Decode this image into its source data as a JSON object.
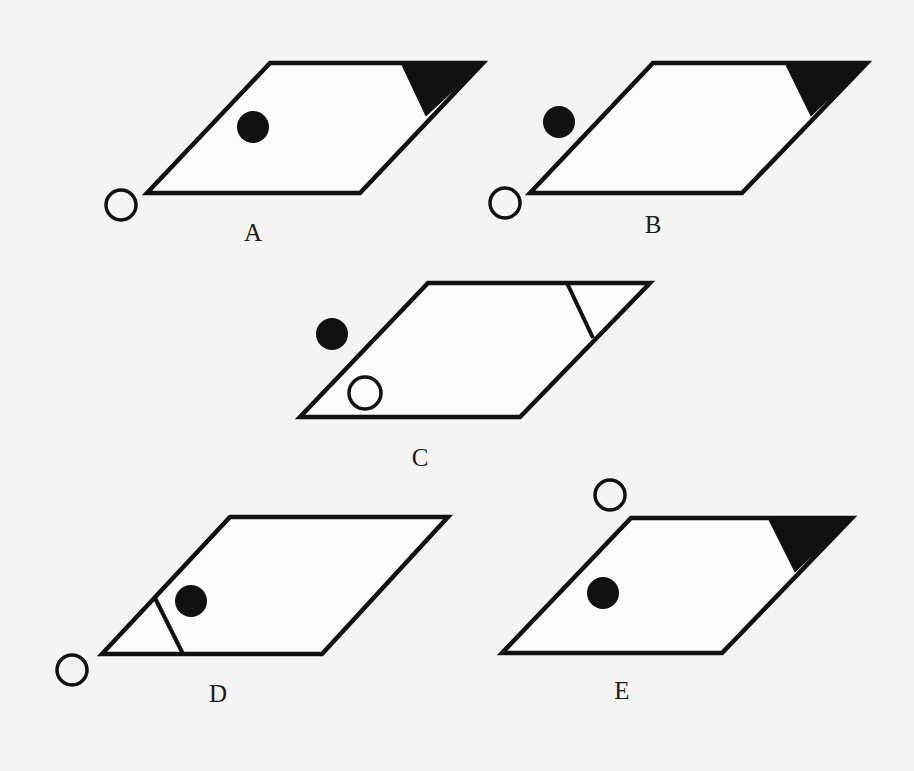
{
  "colors": {
    "ink": "#111111",
    "background": "#f4f4f2",
    "shape_fill": "#fbfbf9"
  },
  "options": [
    {
      "label": "A",
      "label_pos": [
        253,
        232
      ],
      "parallelogram": [
        [
          270,
          63
        ],
        [
          483,
          63
        ],
        [
          360,
          193
        ],
        [
          147,
          193
        ]
      ],
      "corner_mark": {
        "type": "filled-triangle",
        "points": [
          [
            401,
            63
          ],
          [
            483,
            63
          ],
          [
            426,
            116
          ]
        ]
      },
      "filled_dot": {
        "cx": 253,
        "cy": 127,
        "r": 16
      },
      "hollow_circle": {
        "cx": 121,
        "cy": 205,
        "r": 15
      }
    },
    {
      "label": "B",
      "label_pos": [
        653,
        224
      ],
      "parallelogram": [
        [
          653,
          63
        ],
        [
          867,
          63
        ],
        [
          742,
          193
        ],
        [
          530,
          193
        ]
      ],
      "corner_mark": {
        "type": "filled-triangle",
        "points": [
          [
            785,
            63
          ],
          [
            867,
            63
          ],
          [
            811,
            116
          ]
        ]
      },
      "filled_dot": {
        "cx": 559,
        "cy": 122,
        "r": 16
      },
      "hollow_circle": {
        "cx": 505,
        "cy": 203,
        "r": 15
      }
    },
    {
      "label": "C",
      "label_pos": [
        420,
        457
      ],
      "parallelogram": [
        [
          428,
          283
        ],
        [
          650,
          283
        ],
        [
          520,
          417
        ],
        [
          300,
          417
        ]
      ],
      "corner_mark": {
        "type": "line",
        "points": [
          [
            567,
            283
          ],
          [
            593,
            338
          ]
        ]
      },
      "filled_dot": {
        "cx": 332,
        "cy": 334,
        "r": 16
      },
      "hollow_circle": {
        "cx": 365,
        "cy": 393,
        "r": 16
      }
    },
    {
      "label": "D",
      "label_pos": [
        218,
        693
      ],
      "parallelogram": [
        [
          230,
          517
        ],
        [
          448,
          517
        ],
        [
          322,
          654
        ],
        [
          102,
          654
        ]
      ],
      "corner_mark": {
        "type": "line",
        "points": [
          [
            155,
            598
          ],
          [
            183,
            654
          ]
        ]
      },
      "filled_dot": {
        "cx": 191,
        "cy": 601,
        "r": 16
      },
      "hollow_circle": {
        "cx": 72,
        "cy": 670,
        "r": 15
      }
    },
    {
      "label": "E",
      "label_pos": [
        622,
        690
      ],
      "parallelogram": [
        [
          631,
          518
        ],
        [
          852,
          518
        ],
        [
          722,
          653
        ],
        [
          502,
          653
        ]
      ],
      "corner_mark": {
        "type": "filled-triangle",
        "points": [
          [
            768,
            518
          ],
          [
            852,
            518
          ],
          [
            795,
            572
          ]
        ]
      },
      "filled_dot": {
        "cx": 603,
        "cy": 593,
        "r": 16
      },
      "hollow_circle": {
        "cx": 610,
        "cy": 495,
        "r": 15
      }
    }
  ]
}
